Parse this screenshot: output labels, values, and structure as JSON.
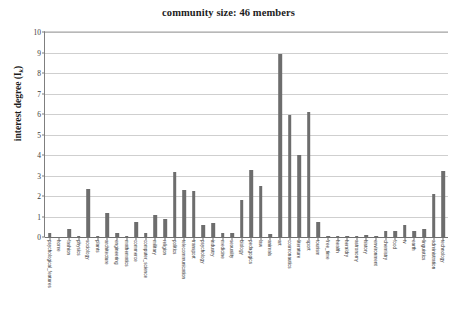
{
  "chart_data": {
    "type": "bar",
    "title": "community size: 46 members",
    "xlabel": "",
    "ylabel": "interest degree (I",
    "ylabel_subscript": "k",
    "ylabel_suffix": ")",
    "ylim": [
      0,
      10
    ],
    "ytick_labels": [
      "0",
      "1",
      "2",
      "3",
      "4",
      "5",
      "6",
      "7",
      "8",
      "9",
      "10"
    ],
    "ytick_values": [
      0,
      1,
      2,
      3,
      4,
      5,
      6,
      7,
      8,
      9,
      10
    ],
    "grid": true,
    "legend": "none",
    "bar_color": "#6d6d6d",
    "categories": [
      "psychological_features",
      "home",
      "fashion",
      "physics",
      "sociology",
      "plants",
      "architecture",
      "engineering",
      "mathematics",
      "commerce",
      "computer_science",
      "military",
      "religion",
      "politics",
      "telecommunication",
      "transport",
      "psychology",
      "industry",
      "medicine",
      "sexuality",
      "biology",
      "pedagogics",
      "law",
      "animals",
      "art",
      "cosmonautics",
      "literature",
      "sport",
      "tourism",
      "free_time",
      "health",
      "heraldry",
      "astronomy",
      "history",
      "environment",
      "chemistry",
      "food",
      "tv",
      "earth",
      "linguistics",
      "administration",
      "technology"
    ],
    "values": [
      0.2,
      0.0,
      0.4,
      0.05,
      2.35,
      0.05,
      1.15,
      0.2,
      0.05,
      0.75,
      0.2,
      1.05,
      0.9,
      3.15,
      2.3,
      2.25,
      0.6,
      0.7,
      0.2,
      0.2,
      1.8,
      3.25,
      2.5,
      0.15,
      8.95,
      5.95,
      4.0,
      6.1,
      0.75,
      0.05,
      0.05,
      0.05,
      0.05,
      0.1,
      0.05,
      0.3,
      0.3,
      0.6,
      0.3,
      0.4,
      2.1,
      3.2
    ]
  }
}
